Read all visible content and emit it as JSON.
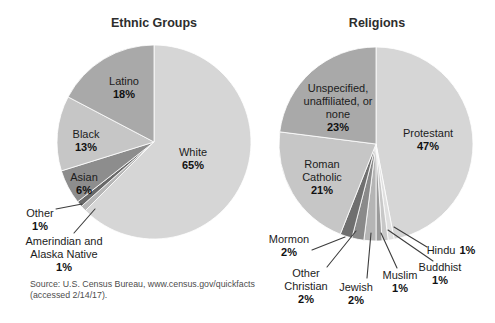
{
  "chart_data": [
    {
      "type": "pie",
      "title": "Ethnic Groups",
      "direction": "clockwise",
      "start_angle_deg": 0,
      "legend_position": "none",
      "segments": [
        {
          "label": "White",
          "value": 65,
          "pct": "65%",
          "color": "#d6d6d6"
        },
        {
          "label": "Amerindian and Alaska Native",
          "value": 1,
          "pct": "1%",
          "color": "#b6b6b6"
        },
        {
          "label": "Other",
          "value": 1,
          "pct": "1%",
          "color": "#696969"
        },
        {
          "label": "Asian",
          "value": 6,
          "pct": "6%",
          "color": "#8d8d8d"
        },
        {
          "label": "Black",
          "value": 13,
          "pct": "13%",
          "color": "#c6c6c6"
        },
        {
          "label": "Latino",
          "value": 18,
          "pct": "18%",
          "color": "#a9a9a9"
        }
      ]
    },
    {
      "type": "pie",
      "title": "Religions",
      "direction": "clockwise",
      "start_angle_deg": 0,
      "legend_position": "none",
      "segments": [
        {
          "label": "Protestant",
          "value": 47,
          "pct": "47%",
          "color": "#d6d6d6"
        },
        {
          "label": "Hindu",
          "value": 1,
          "pct": "1%",
          "color": "#e0e0e0"
        },
        {
          "label": "Buddhist",
          "value": 1,
          "pct": "1%",
          "color": "#c8c8c8"
        },
        {
          "label": "Muslim",
          "value": 1,
          "pct": "1%",
          "color": "#9b9b9b"
        },
        {
          "label": "Jewish",
          "value": 2,
          "pct": "2%",
          "color": "#b5b5b5"
        },
        {
          "label": "Other Christian",
          "value": 2,
          "pct": "2%",
          "color": "#8a8a8a"
        },
        {
          "label": "Mormon",
          "value": 2,
          "pct": "2%",
          "color": "#6f6f6f"
        },
        {
          "label": "Roman Catholic",
          "value": 21,
          "pct": "21%",
          "color": "#c6c6c6"
        },
        {
          "label": "Unspecified, unaffiliated, or none",
          "value": 23,
          "pct": "23%",
          "color": "#a9a9a9"
        }
      ]
    }
  ],
  "source": {
    "line1": "Source: U.S. Census Bureau, www.census.gov/quickfacts",
    "line2": "(accessed 2/14/17)."
  },
  "style": {
    "slice_separator_color": "#ffffff",
    "leader_line_color": "#3d3d3d"
  }
}
